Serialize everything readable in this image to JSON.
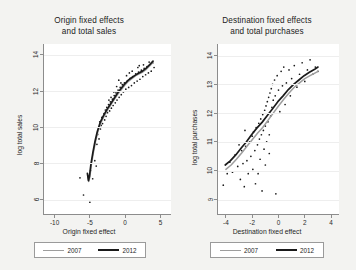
{
  "figure": {
    "background_color": "#f3f3f1",
    "panel_count": 2
  },
  "chart_data": [
    {
      "type": "scatter",
      "panel": "left",
      "title": "Origin fixed effects and total sales",
      "title_line1": "Origin fixed effects",
      "title_line2": "and total sales",
      "xlabel": "Origin fixed effect",
      "ylabel": "log total sales",
      "xlim": [
        -11.5,
        6.5
      ],
      "ylim": [
        5.2,
        14.6
      ],
      "xticks": [
        -10,
        -5,
        0,
        5
      ],
      "xticklabels": [
        "-10",
        "-5",
        "0",
        "5"
      ],
      "yticks": [
        6,
        8,
        10,
        12,
        14
      ],
      "yticklabels": [
        "6",
        "8",
        "10",
        "12",
        "14"
      ],
      "grid": true,
      "legend_position": "below",
      "series": [
        {
          "name": "2007",
          "color": "#9d9d9d",
          "type": "line",
          "points": [
            [
              -5.3,
              7.35
            ],
            [
              -5.15,
              7.0
            ],
            [
              -5.0,
              7.25
            ],
            [
              -4.8,
              7.9
            ],
            [
              -4.5,
              8.6
            ],
            [
              -4.2,
              9.2
            ],
            [
              -3.9,
              9.7
            ],
            [
              -3.5,
              10.2
            ],
            [
              -3.0,
              10.6
            ],
            [
              -2.5,
              10.95
            ],
            [
              -2.0,
              11.25
            ],
            [
              -1.5,
              11.55
            ],
            [
              -1.0,
              11.85
            ],
            [
              -0.5,
              12.1
            ],
            [
              0.0,
              12.35
            ],
            [
              0.5,
              12.55
            ],
            [
              1.0,
              12.7
            ],
            [
              1.5,
              12.85
            ],
            [
              2.0,
              12.95
            ],
            [
              2.5,
              13.05
            ],
            [
              3.0,
              13.2
            ],
            [
              3.5,
              13.4
            ],
            [
              4.0,
              13.6
            ]
          ]
        },
        {
          "name": "2012",
          "color": "#1a1a1a",
          "type": "line",
          "points": [
            [
              -5.35,
              7.45
            ],
            [
              -5.2,
              7.05
            ],
            [
              -5.05,
              7.3
            ],
            [
              -4.85,
              7.95
            ],
            [
              -4.55,
              8.65
            ],
            [
              -4.25,
              9.25
            ],
            [
              -3.95,
              9.75
            ],
            [
              -3.55,
              10.25
            ],
            [
              -3.05,
              10.65
            ],
            [
              -2.55,
              11.0
            ],
            [
              -2.05,
              11.3
            ],
            [
              -1.55,
              11.6
            ],
            [
              -1.05,
              11.9
            ],
            [
              -0.55,
              12.15
            ],
            [
              -0.05,
              12.4
            ],
            [
              0.45,
              12.6
            ],
            [
              0.95,
              12.75
            ],
            [
              1.45,
              12.88
            ],
            [
              1.95,
              13.0
            ],
            [
              2.45,
              13.1
            ],
            [
              2.95,
              13.25
            ],
            [
              3.45,
              13.45
            ],
            [
              3.95,
              13.65
            ]
          ]
        },
        {
          "name": "observations",
          "color": "#1a1a1a",
          "type": "scatter",
          "points": [
            [
              -6.4,
              7.2
            ],
            [
              -5.9,
              6.25
            ],
            [
              -5.0,
              5.85
            ],
            [
              -4.6,
              7.15
            ],
            [
              -4.3,
              8.15
            ],
            [
              -4.1,
              7.85
            ],
            [
              -3.9,
              9.6
            ],
            [
              -3.7,
              9.35
            ],
            [
              -3.6,
              10.3
            ],
            [
              -3.4,
              10.1
            ],
            [
              -3.3,
              10.55
            ],
            [
              -3.2,
              10.2
            ],
            [
              -3.0,
              10.75
            ],
            [
              -2.9,
              10.4
            ],
            [
              -2.8,
              10.95
            ],
            [
              -2.7,
              10.6
            ],
            [
              -2.6,
              11.1
            ],
            [
              -2.5,
              10.8
            ],
            [
              -2.35,
              11.25
            ],
            [
              -2.2,
              10.9
            ],
            [
              -2.1,
              11.4
            ],
            [
              -1.95,
              11.05
            ],
            [
              -1.8,
              11.55
            ],
            [
              -1.7,
              11.2
            ],
            [
              -1.55,
              11.75
            ],
            [
              -1.4,
              11.35
            ],
            [
              -1.3,
              11.9
            ],
            [
              -1.15,
              11.5
            ],
            [
              -1.0,
              12.05
            ],
            [
              -0.85,
              11.65
            ],
            [
              -0.7,
              12.2
            ],
            [
              -0.55,
              11.8
            ],
            [
              -0.4,
              12.35
            ],
            [
              -0.25,
              11.95
            ],
            [
              -0.1,
              12.45
            ],
            [
              0.1,
              12.1
            ],
            [
              0.3,
              12.55
            ],
            [
              0.5,
              12.2
            ],
            [
              0.7,
              12.7
            ],
            [
              0.9,
              12.3
            ],
            [
              1.1,
              12.8
            ],
            [
              1.3,
              12.45
            ],
            [
              1.5,
              12.95
            ],
            [
              1.7,
              12.55
            ],
            [
              1.9,
              13.05
            ],
            [
              2.1,
              12.65
            ],
            [
              2.3,
              13.15
            ],
            [
              2.5,
              12.8
            ],
            [
              2.7,
              13.25
            ],
            [
              2.9,
              12.9
            ],
            [
              3.1,
              13.35
            ],
            [
              3.3,
              13.0
            ],
            [
              3.5,
              13.45
            ],
            [
              3.7,
              13.1
            ],
            [
              3.9,
              13.55
            ],
            [
              4.1,
              13.3
            ],
            [
              -2.0,
              11.65
            ],
            [
              -1.6,
              11.95
            ],
            [
              -1.2,
              12.25
            ],
            [
              -0.6,
              12.45
            ],
            [
              0.2,
              12.85
            ],
            [
              1.0,
              13.1
            ],
            [
              1.8,
              13.3
            ],
            [
              2.6,
              13.45
            ],
            [
              3.4,
              13.6
            ],
            [
              -4.9,
              7.6
            ],
            [
              -4.0,
              9.05
            ],
            [
              -3.5,
              9.9
            ],
            [
              -2.3,
              11.5
            ],
            [
              -0.9,
              12.6
            ],
            [
              0.6,
              13.0
            ],
            [
              2.0,
              13.4
            ]
          ]
        }
      ]
    },
    {
      "type": "scatter",
      "panel": "right",
      "title": "Destination fixed effects and total purchases",
      "title_line1": "Destination fixed effects",
      "title_line2": "and total purchases",
      "xlabel": "Destination fixed effect",
      "ylabel": "log total purchases",
      "xlim": [
        -4.6,
        4.6
      ],
      "ylim": [
        8.5,
        14.4
      ],
      "xticks": [
        -4,
        -2,
        0,
        2,
        4
      ],
      "xticklabels": [
        "-4",
        "-2",
        "0",
        "2",
        "4"
      ],
      "yticks": [
        9,
        10,
        11,
        12,
        13,
        14
      ],
      "yticklabels": [
        "9",
        "10",
        "11",
        "12",
        "13",
        "14"
      ],
      "grid": true,
      "legend_position": "below",
      "series": [
        {
          "name": "2007",
          "color": "#9d9d9d",
          "type": "line",
          "points": [
            [
              -4.0,
              10.05
            ],
            [
              -3.6,
              10.2
            ],
            [
              -3.2,
              10.4
            ],
            [
              -2.8,
              10.62
            ],
            [
              -2.4,
              10.85
            ],
            [
              -2.0,
              11.08
            ],
            [
              -1.6,
              11.3
            ],
            [
              -1.2,
              11.5
            ],
            [
              -0.8,
              11.75
            ],
            [
              -0.4,
              12.0
            ],
            [
              0.0,
              12.25
            ],
            [
              0.4,
              12.48
            ],
            [
              0.8,
              12.7
            ],
            [
              1.2,
              12.9
            ],
            [
              1.6,
              13.05
            ],
            [
              2.0,
              13.2
            ],
            [
              2.4,
              13.3
            ],
            [
              2.8,
              13.4
            ],
            [
              3.0,
              13.45
            ]
          ]
        },
        {
          "name": "2012",
          "color": "#1a1a1a",
          "type": "line",
          "points": [
            [
              -4.05,
              10.2
            ],
            [
              -3.65,
              10.35
            ],
            [
              -3.25,
              10.55
            ],
            [
              -2.85,
              10.78
            ],
            [
              -2.45,
              11.0
            ],
            [
              -2.05,
              11.25
            ],
            [
              -1.65,
              11.48
            ],
            [
              -1.25,
              11.68
            ],
            [
              -0.85,
              11.92
            ],
            [
              -0.45,
              12.15
            ],
            [
              -0.05,
              12.4
            ],
            [
              0.35,
              12.6
            ],
            [
              0.75,
              12.82
            ],
            [
              1.15,
              13.0
            ],
            [
              1.55,
              13.15
            ],
            [
              1.95,
              13.3
            ],
            [
              2.35,
              13.42
            ],
            [
              2.75,
              13.52
            ],
            [
              3.0,
              13.6
            ]
          ]
        },
        {
          "name": "observations",
          "color": "#1a1a1a",
          "type": "scatter",
          "points": [
            [
              -4.2,
              9.5
            ],
            [
              -3.9,
              9.9
            ],
            [
              -3.7,
              10.3
            ],
            [
              -3.5,
              9.95
            ],
            [
              -3.3,
              10.55
            ],
            [
              -3.1,
              10.15
            ],
            [
              -2.9,
              9.7
            ],
            [
              -2.8,
              10.7
            ],
            [
              -2.7,
              10.25
            ],
            [
              -2.6,
              9.45
            ],
            [
              -2.5,
              10.85
            ],
            [
              -2.4,
              10.35
            ],
            [
              -2.3,
              9.9
            ],
            [
              -2.2,
              11.0
            ],
            [
              -2.1,
              10.5
            ],
            [
              -2.0,
              11.2
            ],
            [
              -1.95,
              10.05
            ],
            [
              -1.9,
              11.35
            ],
            [
              -1.8,
              10.7
            ],
            [
              -1.75,
              9.55
            ],
            [
              -1.7,
              11.5
            ],
            [
              -1.6,
              10.9
            ],
            [
              -1.55,
              9.9
            ],
            [
              -1.5,
              11.65
            ],
            [
              -1.45,
              11.1
            ],
            [
              -1.4,
              10.4
            ],
            [
              -1.35,
              11.8
            ],
            [
              -1.3,
              11.25
            ],
            [
              -1.25,
              9.3
            ],
            [
              -1.2,
              11.95
            ],
            [
              -1.15,
              11.4
            ],
            [
              -1.1,
              10.75
            ],
            [
              -1.05,
              12.1
            ],
            [
              -1.0,
              11.55
            ],
            [
              -0.95,
              12.25
            ],
            [
              -0.9,
              11.0
            ],
            [
              -0.85,
              12.4
            ],
            [
              -0.8,
              11.7
            ],
            [
              -0.75,
              12.55
            ],
            [
              -0.7,
              11.25
            ],
            [
              -0.65,
              12.7
            ],
            [
              -0.6,
              11.9
            ],
            [
              -0.55,
              12.85
            ],
            [
              -0.5,
              12.2
            ],
            [
              -0.45,
              13.0
            ],
            [
              -0.4,
              12.45
            ],
            [
              -0.3,
              13.15
            ],
            [
              -0.25,
              12.6
            ],
            [
              -0.2,
              9.2
            ],
            [
              -0.1,
              13.3
            ],
            [
              0.0,
              12.8
            ],
            [
              0.1,
              12.05
            ],
            [
              0.2,
              13.45
            ],
            [
              0.3,
              12.95
            ],
            [
              0.4,
              13.6
            ],
            [
              0.5,
              12.3
            ],
            [
              0.6,
              13.05
            ],
            [
              0.8,
              13.5
            ],
            [
              0.9,
              12.6
            ],
            [
              1.0,
              13.2
            ],
            [
              1.2,
              13.65
            ],
            [
              1.4,
              12.9
            ],
            [
              1.6,
              13.35
            ],
            [
              1.8,
              13.75
            ],
            [
              2.0,
              13.1
            ],
            [
              2.2,
              13.5
            ],
            [
              2.4,
              13.85
            ],
            [
              2.6,
              13.35
            ],
            [
              2.8,
              13.6
            ],
            [
              3.0,
              13.45
            ],
            [
              -3.0,
              10.9
            ],
            [
              -2.55,
              11.4
            ],
            [
              -1.0,
              10.2
            ],
            [
              -0.7,
              10.6
            ]
          ]
        }
      ]
    }
  ],
  "panels": [
    {
      "id": "origin",
      "title_line1": "Origin fixed effects",
      "title_line2": "and total sales",
      "xlabel": "Origin fixed effect",
      "ylabel": "log total sales",
      "yticklabels": [
        "14",
        "12",
        "10",
        "8",
        "6"
      ],
      "xticklabels": [
        "-10",
        "-5",
        "0",
        "5"
      ],
      "legend": [
        {
          "label": "2007",
          "color": "#9d9d9d"
        },
        {
          "label": "2012",
          "color": "#1a1a1a"
        }
      ]
    },
    {
      "id": "destination",
      "title_line1": "Destination fixed effects",
      "title_line2": "and total purchases",
      "xlabel": "Destination fixed effect",
      "ylabel": "log total purchases",
      "yticklabels": [
        "14",
        "13",
        "12",
        "11",
        "10",
        "9"
      ],
      "xticklabels": [
        "-4",
        "-2",
        "0",
        "2",
        "4"
      ],
      "legend": [
        {
          "label": "2007",
          "color": "#9d9d9d"
        },
        {
          "label": "2012",
          "color": "#1a1a1a"
        }
      ]
    }
  ]
}
